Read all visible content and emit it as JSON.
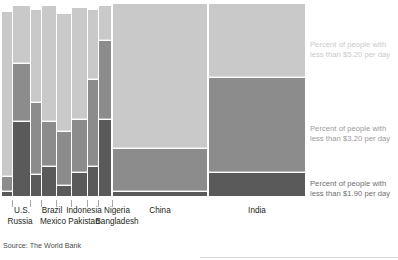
{
  "source_note": "Source: The World Bank",
  "legend": [
    {
      "key": "s520",
      "text": "Percent of people with\nless than $5.20 per day",
      "color": "#c9c9c9",
      "top": 40
    },
    {
      "key": "s320",
      "text": "Percent of people with\nless than $3.20 per day",
      "color": "#8c8c8c",
      "top": 124
    },
    {
      "key": "s190",
      "text": "Percent of people with\nless than $1.90 per day",
      "color": "#5a5a5a",
      "top": 179
    }
  ],
  "chart_data": {
    "type": "bar",
    "subtype": "marimekko-stacked",
    "title": "",
    "xlabel": "",
    "ylabel": "",
    "ylim": [
      0,
      100
    ],
    "grid": false,
    "legend_position": "right",
    "series": [
      {
        "name": "Percent of people with less than $5.20 per day",
        "color": "#c9c9c9"
      },
      {
        "name": "Percent of people with less than $3.20 per day",
        "color": "#8c8c8c"
      },
      {
        "name": "Percent of people with less than $1.90 per day",
        "color": "#5a5a5a"
      }
    ],
    "categories": [
      "Russia",
      "U.S.",
      "Mexico",
      "Brazil",
      "Pakistan",
      "Indonesia",
      "Bangladesh",
      "Nigeria",
      "China",
      "India"
    ],
    "bars": [
      {
        "label": "Russia",
        "x": 2,
        "w": 10,
        "pct_5_20": 95,
        "pct_3_20": 10,
        "pct_1_90": 2,
        "label_row": "bottom",
        "label_cx": 20
      },
      {
        "label": "U.S.",
        "x": 13,
        "w": 17,
        "pct_5_20": 98,
        "pct_3_20": 68,
        "pct_1_90": 38,
        "label_row": "top",
        "label_cx": 22
      },
      {
        "label": "Mexico",
        "x": 31,
        "w": 10,
        "pct_5_20": 96,
        "pct_3_20": 48,
        "pct_1_90": 11,
        "label_row": "bottom",
        "label_cx": 53
      },
      {
        "label": "Brazil",
        "x": 42,
        "w": 14,
        "pct_5_20": 98,
        "pct_3_20": 38,
        "pct_1_90": 15,
        "label_row": "top",
        "label_cx": 52
      },
      {
        "label": "Pakistan",
        "x": 57,
        "w": 14,
        "pct_5_20": 94,
        "pct_3_20": 33,
        "pct_1_90": 5,
        "label_row": "bottom",
        "label_cx": 84
      },
      {
        "label": "Indonesia",
        "x": 72,
        "w": 15,
        "pct_5_20": 97,
        "pct_3_20": 39,
        "pct_1_90": 12,
        "label_row": "top",
        "label_cx": 84
      },
      {
        "label": "Bangladesh",
        "x": 88,
        "w": 10,
        "pct_5_20": 96,
        "pct_3_20": 60,
        "pct_1_90": 15,
        "label_row": "bottom",
        "label_cx": 117
      },
      {
        "label": "Nigeria",
        "x": 99,
        "w": 12,
        "pct_5_20": 98,
        "pct_3_20": 80,
        "pct_1_90": 39,
        "label_row": "top",
        "label_cx": 117
      },
      {
        "label": "China",
        "x": 113,
        "w": 94,
        "pct_5_20": 99,
        "pct_3_20": 24,
        "pct_1_90": 2,
        "label_row": "top",
        "label_cx": 160
      },
      {
        "label": "India",
        "x": 209,
        "w": 96,
        "pct_5_20": 99,
        "pct_3_20": 61,
        "pct_1_90": 12,
        "label_row": "top",
        "label_cx": 257
      }
    ],
    "ticks": [
      {
        "x": 12
      },
      {
        "x": 30
      },
      {
        "x": 41
      },
      {
        "x": 56
      },
      {
        "x": 71
      },
      {
        "x": 87
      },
      {
        "x": 98
      },
      {
        "x": 112
      }
    ]
  }
}
